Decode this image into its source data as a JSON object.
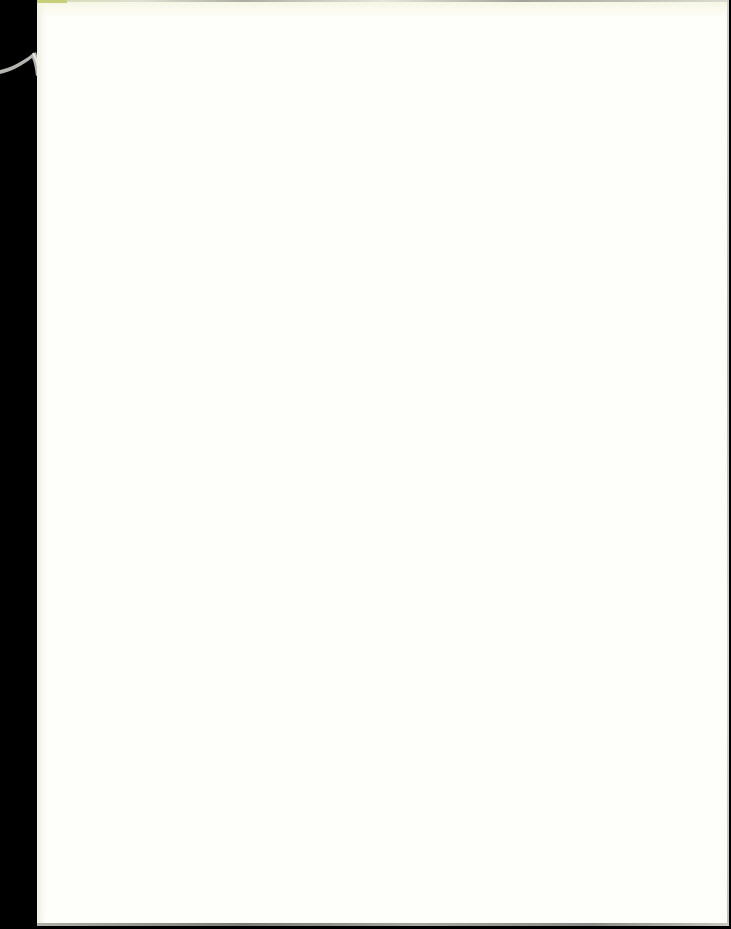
{
  "document": {
    "type": "scanned-blank-page",
    "content_text": "",
    "colors": {
      "scanner_bed": "#000000",
      "paper": "#fefefb",
      "edge_shadow": "#8e8e88",
      "corner_tint": "#c8cf7a",
      "binding_string": "#c8c8c4"
    }
  }
}
